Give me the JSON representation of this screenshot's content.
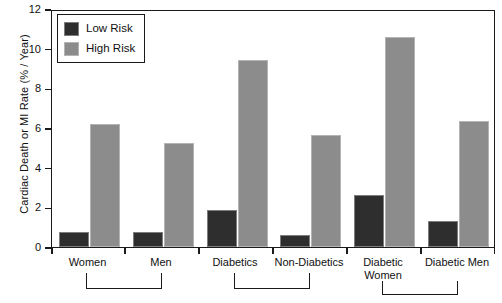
{
  "chart_data": {
    "type": "bar",
    "title": "",
    "xlabel": "",
    "ylabel": "Cardiac Death or MI Rate (% / Year)",
    "ylim": [
      0,
      12
    ],
    "yticks": [
      0,
      2,
      4,
      6,
      8,
      10,
      12
    ],
    "ytick_labels": [
      "0",
      "2",
      "4",
      "6",
      "8",
      "10",
      "12"
    ],
    "grid": false,
    "legend_position": "top-left",
    "categories": [
      "Women",
      "Men",
      "Diabetics",
      "Non-Diabetics",
      "Diabetic Women",
      "Diabetic Men"
    ],
    "series": [
      {
        "name": "Low Risk",
        "color": "#2e2e2e",
        "values": [
          0.75,
          0.75,
          1.9,
          0.6,
          2.65,
          1.3
        ]
      },
      {
        "name": "High Risk",
        "color": "#8c8c8c",
        "values": [
          6.25,
          5.3,
          9.5,
          5.7,
          10.7,
          6.4
        ]
      }
    ],
    "group_brackets": [
      {
        "label": "",
        "from": "Women",
        "to": "Men"
      },
      {
        "label": "",
        "from": "Diabetics",
        "to": "Non-Diabetics"
      },
      {
        "label": "",
        "from": "Diabetic Women",
        "to": "Diabetic Men"
      }
    ]
  },
  "legend": {
    "items": [
      {
        "label": "Low Risk",
        "swatch": "low-risk-swatch"
      },
      {
        "label": "High Risk",
        "swatch": "high-risk-swatch"
      }
    ]
  },
  "axes": {
    "y_title": "Cardiac Death or MI Rate (% / Year)",
    "y_tick_0": "0",
    "y_tick_1": "2",
    "y_tick_2": "4",
    "y_tick_3": "6",
    "y_tick_4": "8",
    "y_tick_5": "10",
    "y_tick_6": "12"
  },
  "x_labels": {
    "g0": "Women",
    "g1": "Men",
    "g2": "Diabetics",
    "g3": "Non-Diabetics",
    "g4_line1": "Diabetic",
    "g4_line2": "Women",
    "g5": "Diabetic Men"
  }
}
